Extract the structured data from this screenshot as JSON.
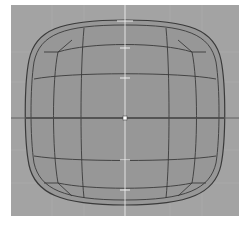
{
  "viewport": {
    "label": "3D modeling viewport",
    "background_color": "#a3a3a3",
    "grid_color": "#b3b3b3",
    "axis_color": "#e8e8e8",
    "mesh_fill": "#979797",
    "mesh_edge": "#3a3a3a"
  },
  "mesh": {
    "name": "subdivided rounded cube (top view)",
    "center": [
      114,
      113
    ]
  }
}
